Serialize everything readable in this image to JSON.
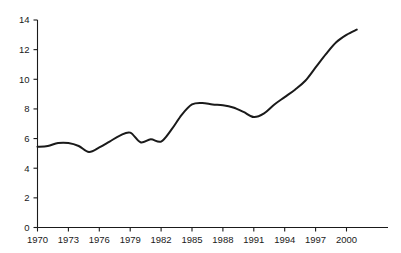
{
  "chart_data": {
    "type": "line",
    "title": "",
    "subtitle": "",
    "xlabel": "",
    "ylabel": "",
    "xlim": [
      1970,
      2001
    ],
    "ylim": [
      0,
      14
    ],
    "grid": false,
    "legend": null,
    "legend_position": "none",
    "line_color": "#1a1a1a",
    "x": [
      1970,
      1971,
      1972,
      1973,
      1974,
      1975,
      1976,
      1977,
      1978,
      1979,
      1980,
      1981,
      1982,
      1983,
      1984,
      1985,
      1986,
      1987,
      1988,
      1989,
      1990,
      1991,
      1992,
      1993,
      1994,
      1995,
      1996,
      1997,
      1998,
      1999,
      2000,
      2001
    ],
    "values": [
      5.45,
      5.5,
      5.7,
      5.7,
      5.5,
      5.1,
      5.4,
      5.8,
      6.2,
      6.4,
      5.75,
      5.95,
      5.8,
      6.6,
      7.6,
      8.3,
      8.4,
      8.3,
      8.25,
      8.1,
      7.8,
      7.45,
      7.7,
      8.3,
      8.8,
      9.3,
      9.9,
      10.8,
      11.7,
      12.5,
      13.0,
      13.35
    ],
    "xticks": [
      1970,
      1973,
      1976,
      1979,
      1982,
      1985,
      1988,
      1991,
      1994,
      1997,
      2000
    ],
    "xtick_labels": [
      "1970",
      "1973",
      "1976",
      "1979",
      "1982",
      "1985",
      "1988",
      "1991",
      "1994",
      "1997",
      "2000"
    ],
    "yticks": [
      0,
      2,
      4,
      6,
      8,
      10,
      12,
      14
    ],
    "ytick_labels": [
      "0",
      "2",
      "4",
      "6",
      "8",
      "10",
      "12",
      "14"
    ]
  }
}
